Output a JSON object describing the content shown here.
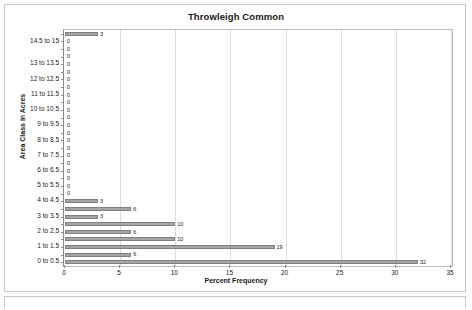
{
  "chart_data": {
    "type": "bar",
    "orientation": "horizontal",
    "title": "Throwleigh Common",
    "xlabel": "Percent Frequency",
    "ylabel": "Area Class in Acres",
    "xlim": [
      0,
      35
    ],
    "xticks": [
      0,
      5,
      10,
      15,
      20,
      25,
      30,
      35
    ],
    "grid": true,
    "legend": "none",
    "bar_color": "#a6a6a6",
    "bar_border_color": "#7f7f7f",
    "data_labels": true,
    "categories": [
      "0 to 0.5",
      "0.5 to 1",
      "1 to 1.5",
      "1.5 to 2",
      "2 to 2.5",
      "2.5 to 3",
      "3 to 3.5",
      "3.5 to 4",
      "4 to 4.5",
      "4.5 to 5",
      "5 to 5.5",
      "5.5 to 6",
      "6 to 6.5",
      "6.5 to 7",
      "7 to 7.5",
      "7.5 to 8",
      "8 to 8.5",
      "8.5 to 9",
      "9 to 9.5",
      "9.5 to 10",
      "10 to 10.5",
      "10.5 to 11",
      "11 to 11.5",
      "11.5 to 12",
      "12 to 12.5",
      "12.5 to 13",
      "13 to 13.5",
      "13.5 to 14",
      "14 to 14.5",
      "14.5 to 15",
      "15 or more"
    ],
    "visible_tick_labels": [
      "0 to 0.5",
      "1 to 1.5",
      "2 to 2.5",
      "3 to 3.5",
      "4 to 4.5",
      "5 to 5.5",
      "6 to 6.5",
      "7 to 7.5",
      "8 to 8.5",
      "9 to 9.5",
      "10 to 10.5",
      "11 to 11.5",
      "12 to 12.5",
      "13 to 13.5",
      "14.5 to 15"
    ],
    "values": [
      32,
      6,
      19,
      10,
      6,
      10,
      3,
      6,
      3,
      0,
      0,
      0,
      0,
      0,
      0,
      0,
      0,
      0,
      0,
      0,
      0,
      0,
      0,
      0,
      0,
      0,
      0,
      0,
      0,
      0,
      3
    ]
  }
}
